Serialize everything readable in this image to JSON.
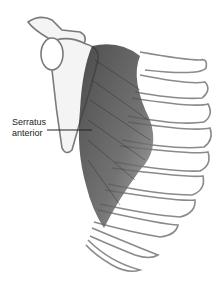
{
  "figure": {
    "label": {
      "line1": "Serratus",
      "line2": "anterior"
    },
    "colors": {
      "background": "#ffffff",
      "outline": "#8a8a8a",
      "muscle_dark": "#3a3a3a",
      "muscle_mid": "#7a7a7a",
      "label_text": "#222222"
    }
  }
}
